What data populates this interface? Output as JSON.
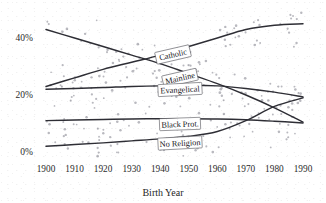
{
  "chart_data": {
    "type": "line",
    "title": "",
    "subtitle": "",
    "xlabel": "Birth Year",
    "ylabel": "",
    "xlim": [
      1900,
      1990
    ],
    "ylim": [
      0,
      46
    ],
    "grid": false,
    "legend_position": "inline-labels",
    "x_ticks": [
      "1900",
      "1910",
      "1920",
      "1930",
      "1940",
      "1950",
      "1960",
      "1970",
      "1980",
      "1990"
    ],
    "y_ticks": [
      "0%",
      "20%",
      "40%"
    ],
    "y_tick_values": [
      0,
      20,
      40
    ],
    "x": [
      1900,
      1910,
      1920,
      1930,
      1940,
      1950,
      1960,
      1970,
      1980,
      1990
    ],
    "series": [
      {
        "name": "Mainline",
        "label": "Mainline",
        "color": "#2e2e35",
        "values": [
          43.0,
          40.0,
          37.0,
          34.0,
          31.0,
          27.5,
          24.0,
          20.0,
          15.5,
          10.5
        ]
      },
      {
        "name": "Catholic",
        "label": "Catholic",
        "color": "#2e2e35",
        "values": [
          23.0,
          26.0,
          29.0,
          31.5,
          34.0,
          37.0,
          40.0,
          43.0,
          44.5,
          45.0
        ]
      },
      {
        "name": "Evangelical",
        "label": "Evangelical",
        "color": "#2e2e35",
        "values": [
          22.0,
          22.3,
          22.6,
          23.0,
          23.2,
          23.4,
          23.2,
          22.3,
          21.0,
          19.3
        ]
      },
      {
        "name": "Black Prot.",
        "label": "Black Prot.",
        "color": "#2e2e35",
        "values": [
          11.0,
          11.2,
          11.4,
          11.6,
          11.7,
          11.7,
          11.6,
          11.3,
          10.8,
          10.2
        ]
      },
      {
        "name": "No Religion",
        "label": "No Religion",
        "color": "#2e2e35",
        "values": [
          2.0,
          2.6,
          3.2,
          3.9,
          4.6,
          5.5,
          7.2,
          11.0,
          16.0,
          19.0
        ]
      }
    ],
    "scatter_note": "light gray observation points scattered around each trend line"
  },
  "axis": {
    "x_title": "Birth Year",
    "y_labels": [
      "40%",
      "20%",
      "0%"
    ],
    "x_labels": [
      "1900",
      "1910",
      "1920",
      "1930",
      "1940",
      "1950",
      "1960",
      "1970",
      "1980",
      "1990"
    ]
  },
  "labels": {
    "catholic": "Catholic",
    "mainline": "Mainline",
    "evangelical": "Evangelical",
    "black_prot": "Black Prot.",
    "no_religion": "No Religion"
  },
  "colors": {
    "line": "#2e2e35",
    "point": "#b9b9bf",
    "text": "#1a1a1a",
    "background": "#ffffff"
  }
}
